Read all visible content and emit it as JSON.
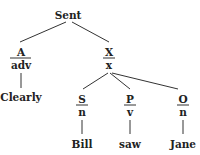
{
  "diagram": {
    "type": "syntax-tree",
    "root": {
      "label": "Sent"
    },
    "nodes": {
      "a": {
        "function": "A",
        "category": "adv",
        "word": "Clearly"
      },
      "x": {
        "function": "X",
        "category": "x"
      },
      "s": {
        "function": "S",
        "category": "n",
        "word": "Bill"
      },
      "p": {
        "function": "P",
        "category": "v",
        "word": "saw"
      },
      "o": {
        "function": "O",
        "category": "n",
        "word": "Jane"
      }
    },
    "edges": [
      [
        "Sent",
        "A"
      ],
      [
        "Sent",
        "X"
      ],
      [
        "A",
        "Clearly"
      ],
      [
        "X",
        "S"
      ],
      [
        "X",
        "P"
      ],
      [
        "X",
        "O"
      ],
      [
        "S",
        "Bill"
      ],
      [
        "P",
        "saw"
      ],
      [
        "O",
        "Jane"
      ]
    ],
    "colors": {
      "ink": "#222222",
      "background": "#ffffff"
    }
  }
}
